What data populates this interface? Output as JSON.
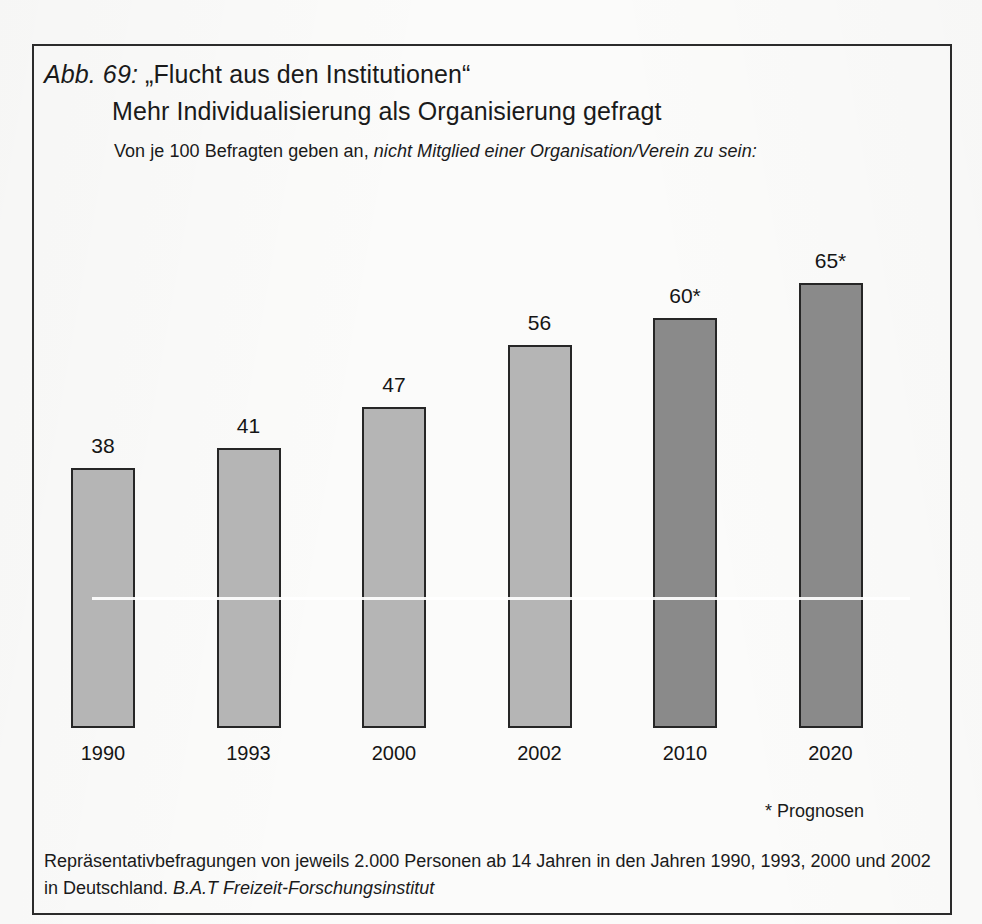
{
  "figure": {
    "number_label": "Abb. 69:",
    "title_line_1": "„Flucht aus den Institutionen“",
    "title_line_2": "Mehr Individualisierung als Organisierung gefragt",
    "subtitle_plain": "Von je 100 Befragten geben an, ",
    "subtitle_italic": "nicht Mitglied einer Organisation/Verein zu sein:",
    "prognosen_note": "* Prognosen",
    "source_plain": "Repräsentativbefragungen von jeweils 2.000 Personen ab 14 Jahren in den Jahren 1990, 1993, 2000 und 2002 in Deutschland. ",
    "source_italic": "B.A.T Freizeit-Forschungsinstitut"
  },
  "colors": {
    "bar_light": "#b5b5b5",
    "bar_dark": "#8a8a8a",
    "bar_outline": "#262626",
    "frame": "#2b2b2b",
    "text": "#1a1a1a",
    "page_background": "#fbfbfa"
  },
  "chart_data": {
    "type": "bar",
    "subtitle": "Von je 100 Befragten geben an, nicht Mitglied einer Organisation/Verein zu sein:",
    "xlabel": "",
    "ylabel": "Von je 100 Befragten",
    "ylim": [
      0,
      70
    ],
    "grid": false,
    "legend": "none",
    "categories": [
      "1990",
      "1993",
      "2000",
      "2002",
      "2010",
      "2020"
    ],
    "values": [
      38,
      41,
      47,
      56,
      60,
      65
    ],
    "value_labels": [
      "38",
      "41",
      "47",
      "56",
      "60*",
      "65*"
    ],
    "is_forecast": [
      false,
      false,
      false,
      false,
      true,
      true
    ],
    "annotations": [
      "* Prognosen"
    ],
    "bars": [
      {
        "category": "1990",
        "value": 38,
        "label": "38",
        "forecast": false
      },
      {
        "category": "1993",
        "value": 41,
        "label": "41",
        "forecast": false
      },
      {
        "category": "2000",
        "value": 47,
        "label": "47",
        "forecast": false
      },
      {
        "category": "2002",
        "value": 56,
        "label": "56",
        "forecast": false
      },
      {
        "category": "2010",
        "value": 60,
        "label": "60*",
        "forecast": true
      },
      {
        "category": "2020",
        "value": 65,
        "label": "65*",
        "forecast": true
      }
    ]
  }
}
